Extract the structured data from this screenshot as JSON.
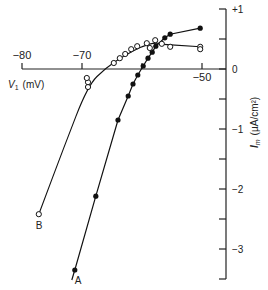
{
  "chart_data": {
    "type": "line",
    "title": "",
    "xlabel": "V1 (mV)",
    "xlabel_main": "V",
    "xlabel_sub": "1",
    "xlabel_unit": "(mV)",
    "ylabel": "Im (µA/cm²)",
    "ylabel_main": "I",
    "ylabel_sub": "m",
    "ylabel_unit": "(µA/cm²)",
    "xlim": [
      -80,
      -46
    ],
    "ylim": [
      -3.5,
      1
    ],
    "x_ticks": [
      -80,
      -70,
      -60,
      -50
    ],
    "x_tick_labels": [
      "−80",
      "−70",
      "",
      "−50"
    ],
    "y_ticks": [
      1,
      0.5,
      0,
      -0.5,
      -1,
      -1.5,
      -2,
      -2.5,
      -3,
      -3.5
    ],
    "y_tick_labels": [
      {
        "value": 1,
        "label": "+1"
      },
      {
        "value": 0,
        "label": "0"
      },
      {
        "value": -1,
        "label": "−1"
      },
      {
        "value": -2,
        "label": "−2"
      },
      {
        "value": -3,
        "label": "−3"
      }
    ],
    "grid": false,
    "legend": "none (curves labeled inline)",
    "series": [
      {
        "name": "A",
        "marker": "filled-circle",
        "x": [
          -71.2,
          -67.7,
          -64.0,
          -62.3,
          -61.5,
          -60.7,
          -59.8,
          -59.0,
          -58.3,
          -57.7,
          -56.2,
          -55.3,
          -50.3
        ],
        "y": [
          -3.35,
          -2.12,
          -0.85,
          -0.45,
          -0.25,
          -0.1,
          0.05,
          0.18,
          0.28,
          0.38,
          0.52,
          0.58,
          0.68
        ]
      },
      {
        "name": "B",
        "marker": "open-circle",
        "x": [
          -77.2,
          -69.0,
          -69.0,
          -69.2,
          -64.7,
          -63.7,
          -62.8,
          -61.8,
          -60.8,
          -59.2,
          -58.7,
          -57.8,
          -56.7,
          -55.3,
          -50.3,
          -50.3
        ],
        "y": [
          -2.42,
          -0.3,
          -0.22,
          -0.15,
          0.1,
          0.18,
          0.25,
          0.33,
          0.38,
          0.43,
          0.35,
          0.48,
          0.42,
          0.37,
          0.37,
          0.33
        ]
      }
    ]
  }
}
